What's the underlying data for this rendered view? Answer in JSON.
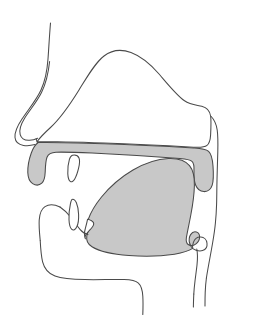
{
  "figure": {
    "type": "anatomical-line-diagram",
    "view": "sagittal",
    "canvas": {
      "width": 256,
      "height": 332
    },
    "background_color": "#FFFFFF",
    "stroke_color": "#4A4A4A",
    "fill_gray": "#C8C8C8",
    "fill_white": "#FFFFFF",
    "has_labels": false,
    "has_text": false
  },
  "parts": [
    {
      "id": "head-profile",
      "label": "Head profile outline",
      "fill": "none",
      "stroke": "#4A4A4A",
      "description": "Forehead, nose bridge, nose tip and nostril contour at upper left"
    },
    {
      "id": "nasal-cavity",
      "label": "Nasal cavity",
      "fill": "#FFFFFF",
      "stroke": "#4A4A4A",
      "description": "Large white dome above the palate extending from nose to nasopharynx"
    },
    {
      "id": "palate-velum",
      "label": "Hard palate, soft palate and uvula",
      "fill": "#C8C8C8",
      "stroke": "#4A4A4A",
      "description": "Gray band forming the roof of the mouth, curving down at the back into the velum and uvula"
    },
    {
      "id": "upper-lip",
      "label": "Upper lip",
      "fill": "#C8C8C8",
      "stroke": "#4A4A4A",
      "description": "Rounded gray lobe at the front left of the palate band"
    },
    {
      "id": "upper-incisor",
      "label": "Upper incisor tooth",
      "fill": "#FFFFFF",
      "stroke": "#4A4A4A",
      "description": "White wedge pointing downward from the alveolar ridge"
    },
    {
      "id": "lower-lip",
      "label": "Lower lip",
      "fill": "#FFFFFF",
      "stroke": "#4A4A4A",
      "description": "White rounded lobe at the front of the lower jaw"
    },
    {
      "id": "lower-incisor",
      "label": "Lower incisor tooth",
      "fill": "#FFFFFF",
      "stroke": "#4A4A4A",
      "description": "White wedge pointing upward from the mandible"
    },
    {
      "id": "tongue",
      "label": "Tongue",
      "fill": "#C8C8C8",
      "stroke": "#4A4A4A",
      "description": "Large gray mass filling the oral cavity, tip at front, root curving into the pharynx"
    },
    {
      "id": "jaw-chin",
      "label": "Lower jaw and chin contour",
      "fill": "none",
      "stroke": "#4A4A4A",
      "description": "Open curve from the lower lip around the chin to the neck"
    },
    {
      "id": "pharyngeal-wall",
      "label": "Posterior pharyngeal wall",
      "fill": "none",
      "stroke": "#4A4A4A",
      "description": "Vertical lines at the right descending from the nasopharynx to the neck"
    },
    {
      "id": "epiglottis",
      "label": "Epiglottis",
      "fill": "none",
      "stroke": "#4A4A4A",
      "description": "Small hooked curve below the tongue root at the entrance of the larynx"
    },
    {
      "id": "larynx-neck",
      "label": "Larynx and neck outline",
      "fill": "none",
      "stroke": "#4A4A4A",
      "description": "Pair of descending lines at the lower right forming the throat"
    }
  ]
}
